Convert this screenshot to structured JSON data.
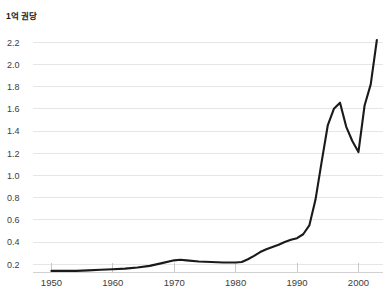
{
  "chart_data": {
    "type": "line",
    "title": "1억 권당",
    "subtitle": "",
    "xlabel": "",
    "ylabel": "",
    "xlim": [
      1947,
      2004
    ],
    "ylim": [
      0.13,
      2.31
    ],
    "grid": true,
    "legend": null,
    "line_color": "#1a1a1a",
    "grid_color": "#e6e6e6",
    "background_color": "#ffffff",
    "yticks": [
      0.2,
      0.4,
      0.6,
      0.8,
      1.0,
      1.2,
      1.4,
      1.6,
      1.8,
      2.0,
      2.2
    ],
    "ytick_labels": [
      "0.2",
      "0.4",
      "0.6",
      "0.8",
      "1.0",
      "1.2",
      "1.4",
      "1.6",
      "1.8",
      "2.0",
      "2.2"
    ],
    "xticks": [
      1950,
      1960,
      1970,
      1980,
      1990,
      2000
    ],
    "xtick_labels": [
      "1950",
      "1960",
      "1970",
      "1980",
      "1990",
      "2000"
    ],
    "series": [
      {
        "name": "1억 권당",
        "x": [
          1950,
          1952,
          1954,
          1956,
          1958,
          1960,
          1962,
          1964,
          1966,
          1968,
          1970,
          1971,
          1972,
          1974,
          1976,
          1978,
          1980,
          1981,
          1982,
          1983,
          1984,
          1985,
          1986,
          1987,
          1988,
          1989,
          1990,
          1991,
          1992,
          1993,
          1994,
          1995,
          1996,
          1997,
          1998,
          1999,
          2000,
          2001,
          2002,
          2003
        ],
        "values": [
          0.14,
          0.14,
          0.14,
          0.145,
          0.15,
          0.155,
          0.16,
          0.17,
          0.185,
          0.21,
          0.235,
          0.24,
          0.235,
          0.225,
          0.22,
          0.215,
          0.215,
          0.22,
          0.245,
          0.275,
          0.31,
          0.335,
          0.355,
          0.375,
          0.4,
          0.42,
          0.435,
          0.47,
          0.55,
          0.78,
          1.12,
          1.45,
          1.6,
          1.655,
          1.44,
          1.31,
          1.21,
          1.63,
          1.82,
          2.22
        ]
      }
    ]
  }
}
